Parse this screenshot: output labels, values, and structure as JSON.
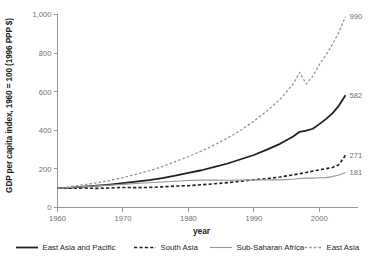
{
  "chart_data": {
    "type": "line",
    "title": "",
    "xlabel": "year",
    "ylabel": "GDP per capita index, 1960 = 100 (1996 PPP $)",
    "xlim": [
      1960,
      2004
    ],
    "ylim": [
      0,
      1000
    ],
    "grid": false,
    "legend_position": "bottom",
    "xticks": [
      1960,
      1970,
      1980,
      1990,
      2000
    ],
    "xtick_labels": [
      "1960",
      "1970",
      "1980",
      "1990",
      "2000"
    ],
    "yticks": [
      0,
      200,
      400,
      600,
      800,
      1000
    ],
    "ytick_labels": [
      "0",
      "200",
      "400",
      "600",
      "800",
      "1,000"
    ],
    "x": [
      1960,
      1962,
      1964,
      1966,
      1968,
      1970,
      1972,
      1974,
      1976,
      1978,
      1980,
      1982,
      1984,
      1986,
      1988,
      1990,
      1992,
      1994,
      1996,
      1997,
      1998,
      1999,
      2000,
      2001,
      2002,
      2003,
      2004
    ],
    "series": [
      {
        "name": "East Asia and Pacific",
        "style": "solid",
        "color": "#231f20",
        "width": 1.8,
        "end_label": "582",
        "end_value": 582,
        "values": [
          100,
          103,
          108,
          113,
          119,
          126,
          134,
          142,
          152,
          165,
          180,
          193,
          210,
          228,
          250,
          272,
          300,
          330,
          368,
          392,
          398,
          408,
          432,
          458,
          488,
          528,
          582
        ]
      },
      {
        "name": "South Asia",
        "style": "dashed",
        "color": "#231f20",
        "width": 1.6,
        "end_label": "271",
        "end_value": 271,
        "values": [
          100,
          100,
          101,
          99,
          101,
          104,
          103,
          104,
          107,
          111,
          113,
          118,
          123,
          129,
          136,
          144,
          150,
          158,
          169,
          175,
          181,
          189,
          195,
          201,
          207,
          222,
          271
        ]
      },
      {
        "name": "Sub-Saharan Africa",
        "style": "solid",
        "color": "#939598",
        "width": 1.1,
        "end_label": "181",
        "end_value": 181,
        "values": [
          100,
          104,
          108,
          112,
          116,
          120,
          124,
          128,
          132,
          136,
          140,
          142,
          142,
          141,
          142,
          143,
          143,
          143,
          146,
          150,
          152,
          152,
          154,
          155,
          160,
          168,
          181
        ]
      },
      {
        "name": "East Asia",
        "style": "dashed",
        "color": "#939598",
        "width": 1.3,
        "end_label": "990",
        "end_value": 990,
        "values": [
          100,
          108,
          118,
          128,
          140,
          155,
          172,
          190,
          212,
          238,
          264,
          292,
          325,
          360,
          400,
          448,
          500,
          560,
          640,
          700,
          640,
          680,
          740,
          790,
          845,
          910,
          990
        ]
      }
    ]
  },
  "legend": {
    "items": [
      {
        "label": "East Asia and Pacific",
        "style": "solid",
        "color": "#231f20",
        "width": 1.8
      },
      {
        "label": "South Asia",
        "style": "dashed",
        "color": "#231f20",
        "width": 1.6
      },
      {
        "label": "Sub-Saharan Africa",
        "style": "solid",
        "color": "#939598",
        "width": 1.1
      },
      {
        "label": "East Asia",
        "style": "dashed",
        "color": "#939598",
        "width": 1.3
      }
    ]
  },
  "colors": {
    "dark": "#231f20",
    "gray": "#939598",
    "tick_text": "#6d6e71",
    "background": "#ffffff"
  }
}
